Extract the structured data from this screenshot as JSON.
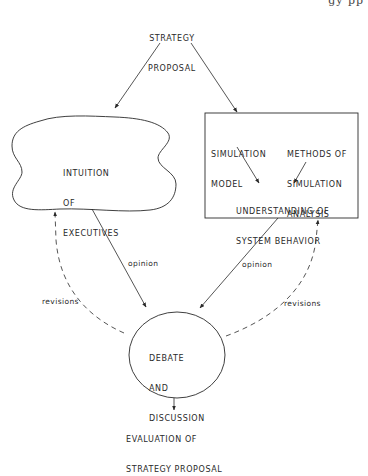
{
  "header_fragment": "gy  pp",
  "nodes": {
    "strategy_proposal": {
      "line1": "STRATEGY",
      "line2": "PROPOSAL"
    },
    "intuition": {
      "line1": "INTUITION",
      "line2": "OF",
      "line3": "EXECUTIVES"
    },
    "simulation_box": {
      "simulation_model": {
        "line1": "SIMULATION",
        "line2": "MODEL"
      },
      "methods": {
        "line1": "METHODS OF",
        "line2": "SIMULATION",
        "line3": "ANALYSIS"
      },
      "understanding": {
        "line1": "UNDERSTANDING OF",
        "line2": "SYSTEM BEHAVIOR"
      }
    },
    "debate": {
      "line1": "DEBATE",
      "line2": "AND",
      "line3": "DISCUSSION"
    },
    "evaluation": {
      "line1": "EVALUATION OF",
      "line2": "STRATEGY PROPOSAL"
    }
  },
  "edges": {
    "opinion_left": "opinion",
    "opinion_right": "opinion",
    "revisions_left": "revisions",
    "revisions_right": "revisions"
  },
  "colors": {
    "ink": "#2a2a2a",
    "background": "#ffffff"
  }
}
